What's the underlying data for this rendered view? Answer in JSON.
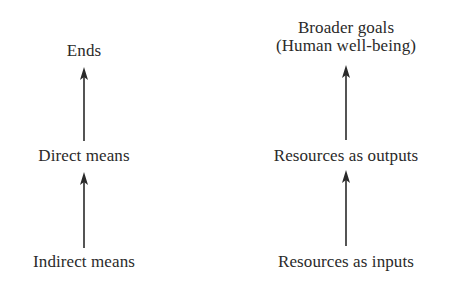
{
  "diagram": {
    "left_column": {
      "top": "Ends",
      "middle": "Direct means",
      "bottom": "Indirect means"
    },
    "right_column": {
      "top_line1": "Broader goals",
      "top_line2": "(Human well-being)",
      "middle": "Resources as outputs",
      "bottom": "Resources as inputs"
    },
    "colors": {
      "text": "#2a2a2a",
      "arrow": "#2a2a2a",
      "background": "#ffffff"
    }
  }
}
